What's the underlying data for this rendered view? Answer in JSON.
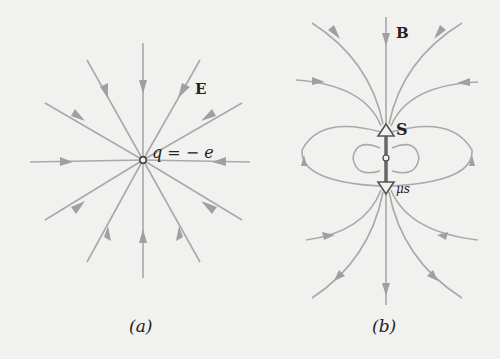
{
  "panel_a": {
    "field_label": "E",
    "charge_label": "q = − e",
    "caption": "(a)"
  },
  "panel_b": {
    "field_label": "B",
    "spin_label": "S",
    "moment_label": "μs",
    "caption": "(b)"
  },
  "colors": {
    "background": "#f1f1f0",
    "field_line": "#a9a9a9",
    "spin_arrow": "#666666",
    "text": "#222222"
  }
}
